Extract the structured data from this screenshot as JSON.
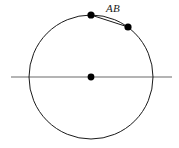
{
  "figure": {
    "background_color": "#ffffff",
    "canvas": {
      "width": 179,
      "height": 148
    }
  },
  "labels": {
    "chord_label": "AB"
  },
  "colors": {
    "stroke": "#1a1a1a",
    "axis_line": "#6b6b6b",
    "point_fill": "#000000",
    "background": "#ffffff"
  },
  "geometry": {
    "circle": {
      "center_x": 91,
      "center_y": 77,
      "radius": 62,
      "stroke_width": 1
    },
    "horizontal_line": {
      "x1": 11,
      "x2": 172,
      "y": 77,
      "stroke_width": 1.2
    },
    "points": [
      {
        "name": "center",
        "x": 91,
        "y": 77,
        "r": 3.4
      },
      {
        "name": "A",
        "x": 91,
        "y": 15,
        "r": 3.6
      },
      {
        "name": "B",
        "x": 128,
        "y": 27,
        "r": 3.6
      }
    ],
    "chord": {
      "x1": 91,
      "y1": 15,
      "x2": 128,
      "y2": 27,
      "stroke_width": 1
    },
    "label_position": {
      "x": 106,
      "y": 12
    }
  }
}
